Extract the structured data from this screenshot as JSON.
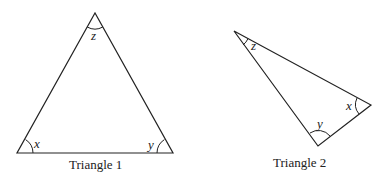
{
  "diagram": {
    "triangles": [
      {
        "caption": "Triangle 1",
        "vertices": {
          "x": [
            17,
            153
          ],
          "y": [
            173,
            153
          ],
          "z": [
            95,
            13
          ]
        },
        "angle_labels": {
          "x": "x",
          "y": "y",
          "z": "z"
        }
      },
      {
        "caption": "Triangle 2",
        "vertices": {
          "z": [
            234,
            31
          ],
          "x": [
            371,
            105
          ],
          "y": [
            318,
            146
          ]
        },
        "angle_labels": {
          "x": "x",
          "y": "y",
          "z": "z"
        }
      }
    ]
  }
}
